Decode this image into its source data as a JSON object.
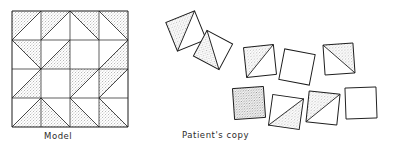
{
  "figure": {
    "background_color": "#ffffff",
    "line_color": "#1a1a1a",
    "stipple_color": "#8a8a8a",
    "fill_color": "#ffffff",
    "width": 396,
    "height": 156
  },
  "captions": {
    "model_label": "Model",
    "patient_label": "Patient's copy"
  },
  "model": {
    "name": "model-pinwheel-grid",
    "origin_x": 12,
    "origin_y": 11,
    "size": 116,
    "rows": 4,
    "cols": 4,
    "cell_size": 29,
    "description": "Four-by-four grid of square tiles forming a pinwheel pattern of stippled half-square triangles",
    "tiles": [
      {
        "row": 0,
        "col": 0,
        "pattern": "half-triangle",
        "shaded_corner": "upper-left"
      },
      {
        "row": 0,
        "col": 1,
        "pattern": "half-triangle",
        "shaded_corner": "upper-left"
      },
      {
        "row": 0,
        "col": 2,
        "pattern": "half-triangle",
        "shaded_corner": "upper-right"
      },
      {
        "row": 0,
        "col": 3,
        "pattern": "half-triangle",
        "shaded_corner": "upper-right"
      },
      {
        "row": 1,
        "col": 0,
        "pattern": "half-triangle",
        "shaded_corner": "upper-right"
      },
      {
        "row": 1,
        "col": 1,
        "pattern": "half-triangle",
        "shaded_corner": "lower-right"
      },
      {
        "row": 1,
        "col": 2,
        "pattern": "blank",
        "shaded_corner": "none"
      },
      {
        "row": 1,
        "col": 3,
        "pattern": "half-triangle",
        "shaded_corner": "lower-right"
      },
      {
        "row": 2,
        "col": 0,
        "pattern": "half-triangle",
        "shaded_corner": "lower-right"
      },
      {
        "row": 2,
        "col": 1,
        "pattern": "blank",
        "shaded_corner": "none"
      },
      {
        "row": 2,
        "col": 2,
        "pattern": "half-triangle",
        "shaded_corner": "upper-left"
      },
      {
        "row": 2,
        "col": 3,
        "pattern": "half-triangle",
        "shaded_corner": "upper-left"
      },
      {
        "row": 3,
        "col": 0,
        "pattern": "half-triangle",
        "shaded_corner": "lower-right"
      },
      {
        "row": 3,
        "col": 1,
        "pattern": "half-triangle",
        "shaded_corner": "lower-left"
      },
      {
        "row": 3,
        "col": 2,
        "pattern": "half-triangle",
        "shaded_corner": "lower-left"
      },
      {
        "row": 3,
        "col": 3,
        "pattern": "half-triangle",
        "shaded_corner": "lower-left"
      }
    ]
  },
  "patient_copy": {
    "name": "patient-copy-scattered-tiles",
    "description": "Nine loose square tiles, rotated and displaced, failing to form the model's square outline",
    "tile_count": 9,
    "tiles": [
      {
        "index": 0,
        "cx": 186,
        "cy": 31,
        "size": 31,
        "rotation": -22,
        "pattern": "half-triangle",
        "shaded_corner": "upper-left"
      },
      {
        "index": 1,
        "cx": 213,
        "cy": 50,
        "size": 29,
        "rotation": 28,
        "pattern": "half-triangle",
        "shaded_corner": "lower-left"
      },
      {
        "index": 2,
        "cx": 260,
        "cy": 61,
        "size": 30,
        "rotation": -6,
        "pattern": "half-triangle",
        "shaded_corner": "upper-left"
      },
      {
        "index": 3,
        "cx": 297,
        "cy": 67,
        "size": 31,
        "rotation": 11,
        "pattern": "blank",
        "shaded_corner": "none"
      },
      {
        "index": 4,
        "cx": 339,
        "cy": 59,
        "size": 30,
        "rotation": -4,
        "pattern": "half-triangle",
        "shaded_corner": "upper-right"
      },
      {
        "index": 5,
        "cx": 249,
        "cy": 103,
        "size": 31,
        "rotation": -4,
        "pattern": "solid",
        "shaded_corner": "all"
      },
      {
        "index": 6,
        "cx": 286,
        "cy": 112,
        "size": 31,
        "rotation": 8,
        "pattern": "half-triangle",
        "shaded_corner": "lower-right"
      },
      {
        "index": 7,
        "cx": 323,
        "cy": 108,
        "size": 31,
        "rotation": 6,
        "pattern": "half-triangle",
        "shaded_corner": "upper-left"
      },
      {
        "index": 8,
        "cx": 361,
        "cy": 103,
        "size": 31,
        "rotation": -2,
        "pattern": "blank",
        "shaded_corner": "none"
      }
    ]
  }
}
